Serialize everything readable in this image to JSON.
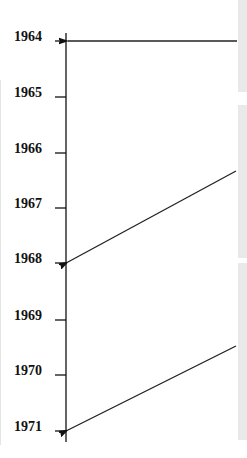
{
  "timeline": {
    "years": [
      {
        "label": "1964",
        "y": 41
      },
      {
        "label": "1965",
        "y": 97
      },
      {
        "label": "1966",
        "y": 153
      },
      {
        "label": "1967",
        "y": 208
      },
      {
        "label": "1968",
        "y": 263
      },
      {
        "label": "1969",
        "y": 320
      },
      {
        "label": "1970",
        "y": 375
      },
      {
        "label": "1971",
        "y": 431
      }
    ],
    "axis_color": "#111111",
    "arrows": [
      {
        "from_panel": 0,
        "to_year": "1964"
      },
      {
        "from_panel": 1,
        "to_year": "1968"
      },
      {
        "from_panel": 2,
        "to_year": "1971"
      }
    ]
  },
  "panels": [
    {
      "top": 0,
      "height": 92,
      "color": "#e9e9e9"
    },
    {
      "top": 105,
      "height": 153,
      "color": "#e9e9e9"
    },
    {
      "top": 263,
      "height": 177,
      "color": "#e9e9e9"
    }
  ]
}
